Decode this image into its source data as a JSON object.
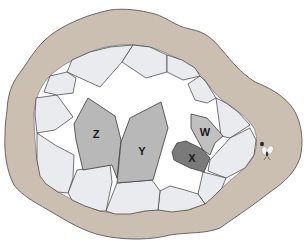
{
  "diagram": {
    "colors": {
      "outer_shell": "#cbbfb2",
      "cavity_background": "#ffffff",
      "outer_crystals": "#e9ebee",
      "crystal_z": "#b8b8b8",
      "crystal_y": "#b8b8b8",
      "crystal_w": "#bfbfbf",
      "crystal_x": "#7a7a7a",
      "outline": "#3b3b3b"
    },
    "labels": {
      "z": "Z",
      "y": "Y",
      "w": "W",
      "x": "X"
    }
  }
}
